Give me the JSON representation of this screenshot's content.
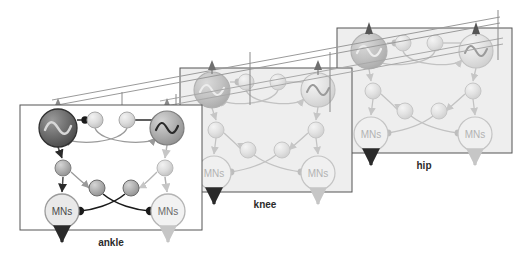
{
  "figure": {
    "title": "",
    "background_color": "#ffffff",
    "width": 526,
    "height": 265
  },
  "palette": {
    "dark_node": "#6e6e6e",
    "dark_node_edge": "#3a3a3a",
    "mid_node": "#b0b0b0",
    "mid_node_edge": "#8a8a8a",
    "light_node": "#d8d8d8",
    "light_node_edge": "#b8b8b8",
    "faded_node": "#dcdcdc",
    "faded_edge": "#c6c6c6",
    "box_stroke_dark": "#555555",
    "box_stroke_light": "#b4b4b4",
    "box_fill_ankle": "#ffffff",
    "box_fill_faded": "#eeeeee",
    "connector_dark": "#1a1a1a",
    "connector_mid": "#8f8f8f",
    "connector_light": "#c2c2c2",
    "label_color": "#2b2b2b"
  },
  "modules": [
    {
      "id": "ankle",
      "label": "ankle",
      "state": "foreground",
      "box": {
        "x": 20,
        "y": 105,
        "w": 182,
        "h": 125
      },
      "label_pos": {
        "x": 111,
        "y": 246
      },
      "nodes": {
        "oscillator_left": {
          "name": "oscillator-left",
          "glyph": "sine-wave",
          "cx": 58,
          "cy": 128,
          "r": 19,
          "tone": "dark"
        },
        "oscillator_right": {
          "name": "oscillator-right",
          "glyph": "sine-wave",
          "cx": 167,
          "cy": 128,
          "r": 17,
          "tone": "mid"
        },
        "interneuron_top_left": {
          "name": "interneuron-top-left",
          "cx": 95,
          "cy": 120,
          "r": 8,
          "tone": "light"
        },
        "interneuron_top_right": {
          "name": "interneuron-top-right",
          "cx": 127,
          "cy": 120,
          "r": 8,
          "tone": "light"
        },
        "relay_left": {
          "name": "relay-left",
          "cx": 63,
          "cy": 168,
          "r": 8,
          "tone": "mid"
        },
        "relay_right": {
          "name": "relay-right",
          "cx": 165,
          "cy": 168,
          "r": 8,
          "tone": "light"
        },
        "interneuron_mid_left": {
          "name": "interneuron-mid-left",
          "cx": 97,
          "cy": 188,
          "r": 8,
          "tone": "dark"
        },
        "interneuron_mid_right": {
          "name": "interneuron-mid-right",
          "cx": 131,
          "cy": 188,
          "r": 8,
          "tone": "dark"
        },
        "mns_left": {
          "name": "motor-neurons-left",
          "label": "MNs",
          "cx": 62,
          "cy": 211,
          "r": 17,
          "tone": "light"
        },
        "mns_right": {
          "name": "motor-neurons-right",
          "label": "MNs",
          "cx": 168,
          "cy": 211,
          "r": 17,
          "tone": "light"
        }
      },
      "output_arrows": [
        {
          "name": "output-arrow-left",
          "x": 62,
          "y_from": 228,
          "y_to": 248,
          "tone": "dark"
        },
        {
          "name": "output-arrow-right",
          "x": 168,
          "y_from": 228,
          "y_to": 248,
          "tone": "light"
        }
      ]
    },
    {
      "id": "knee",
      "label": "knee",
      "state": "faded",
      "box": {
        "x": 180,
        "y": 68,
        "w": 172,
        "h": 124
      },
      "label_pos": {
        "x": 265,
        "y": 208
      },
      "nodes": {
        "oscillator_left": {
          "name": "oscillator-left",
          "glyph": "sine-wave",
          "cx": 212,
          "cy": 90,
          "r": 18,
          "tone": "faded-dark"
        },
        "oscillator_right": {
          "name": "oscillator-right",
          "glyph": "sine-wave",
          "cx": 318,
          "cy": 90,
          "r": 17,
          "tone": "faded"
        },
        "interneuron_top_left": {
          "name": "interneuron-top-left",
          "cx": 246,
          "cy": 82,
          "r": 8,
          "tone": "faded"
        },
        "interneuron_top_right": {
          "name": "interneuron-top-right",
          "cx": 278,
          "cy": 82,
          "r": 8,
          "tone": "faded"
        },
        "relay_left": {
          "name": "relay-left",
          "cx": 216,
          "cy": 130,
          "r": 8,
          "tone": "faded"
        },
        "relay_right": {
          "name": "relay-right",
          "cx": 316,
          "cy": 130,
          "r": 8,
          "tone": "faded"
        },
        "interneuron_mid_left": {
          "name": "interneuron-mid-left",
          "cx": 248,
          "cy": 150,
          "r": 8,
          "tone": "faded"
        },
        "interneuron_mid_right": {
          "name": "interneuron-mid-right",
          "cx": 282,
          "cy": 150,
          "r": 8,
          "tone": "faded"
        },
        "mns_left": {
          "name": "motor-neurons-left",
          "label": "MNs",
          "cx": 214,
          "cy": 173,
          "r": 17,
          "tone": "faded"
        },
        "mns_right": {
          "name": "motor-neurons-right",
          "label": "MNs",
          "cx": 318,
          "cy": 173,
          "r": 17,
          "tone": "faded"
        }
      },
      "output_arrows": [
        {
          "name": "output-arrow-left",
          "x": 214,
          "y_from": 190,
          "y_to": 210,
          "tone": "dark"
        },
        {
          "name": "output-arrow-right",
          "x": 318,
          "y_from": 190,
          "y_to": 210,
          "tone": "light"
        }
      ]
    },
    {
      "id": "hip",
      "label": "hip",
      "state": "faded",
      "box": {
        "x": 337,
        "y": 28,
        "w": 175,
        "h": 125
      },
      "label_pos": {
        "x": 424,
        "y": 169
      },
      "nodes": {
        "oscillator_left": {
          "name": "oscillator-left",
          "glyph": "sine-wave",
          "cx": 369,
          "cy": 51,
          "r": 18,
          "tone": "faded-dark"
        },
        "oscillator_right": {
          "name": "oscillator-right",
          "glyph": "sine-wave",
          "cx": 476,
          "cy": 51,
          "r": 17,
          "tone": "faded"
        },
        "interneuron_top_left": {
          "name": "interneuron-top-left",
          "cx": 403,
          "cy": 43,
          "r": 8,
          "tone": "faded"
        },
        "interneuron_top_right": {
          "name": "interneuron-top-right",
          "cx": 435,
          "cy": 43,
          "r": 8,
          "tone": "faded"
        },
        "relay_left": {
          "name": "relay-left",
          "cx": 373,
          "cy": 91,
          "r": 8,
          "tone": "faded"
        },
        "relay_right": {
          "name": "relay-right",
          "cx": 473,
          "cy": 91,
          "r": 8,
          "tone": "faded"
        },
        "interneuron_mid_left": {
          "name": "interneuron-mid-left",
          "cx": 405,
          "cy": 111,
          "r": 8,
          "tone": "faded"
        },
        "interneuron_mid_right": {
          "name": "interneuron-mid-right",
          "cx": 439,
          "cy": 111,
          "r": 8,
          "tone": "faded"
        },
        "mns_left": {
          "name": "motor-neurons-left",
          "label": "MNs",
          "cx": 371,
          "cy": 134,
          "r": 17,
          "tone": "faded"
        },
        "mns_right": {
          "name": "motor-neurons-right",
          "label": "MNs",
          "cx": 475,
          "cy": 134,
          "r": 17,
          "tone": "faded"
        }
      },
      "output_arrows": [
        {
          "name": "output-arrow-left",
          "x": 371,
          "y_from": 151,
          "y_to": 171,
          "tone": "dark"
        },
        {
          "name": "output-arrow-right",
          "x": 475,
          "y_from": 151,
          "y_to": 171,
          "tone": "light"
        }
      ]
    }
  ],
  "intermodule": {
    "description": "long diagonal feedback rails running from the ankle module up to the hip module",
    "rails": [
      {
        "name": "rail-upper",
        "x1": 52,
        "y1": 100,
        "x2": 500,
        "y2": 18
      },
      {
        "name": "rail-lower",
        "x1": 52,
        "y1": 106,
        "x2": 500,
        "y2": 24
      }
    ],
    "rail_arrows": [
      {
        "name": "rail-arrow-ankle-left",
        "x": 58,
        "y": 103
      },
      {
        "name": "rail-arrow-ankle-right",
        "x": 167,
        "y": 103
      },
      {
        "name": "rail-arrow-knee-left",
        "x": 212,
        "y": 64
      },
      {
        "name": "rail-arrow-knee-right",
        "x": 318,
        "y": 64
      },
      {
        "name": "rail-arrow-hip-left",
        "x": 369,
        "y": 25
      },
      {
        "name": "rail-arrow-hip-right",
        "x": 476,
        "y": 25
      }
    ]
  },
  "legend": {
    "connection_types": [
      {
        "name": "excitatory-connection",
        "marker": "triangle-arrowhead"
      },
      {
        "name": "inhibitory-connection",
        "marker": "filled-circle"
      }
    ]
  }
}
